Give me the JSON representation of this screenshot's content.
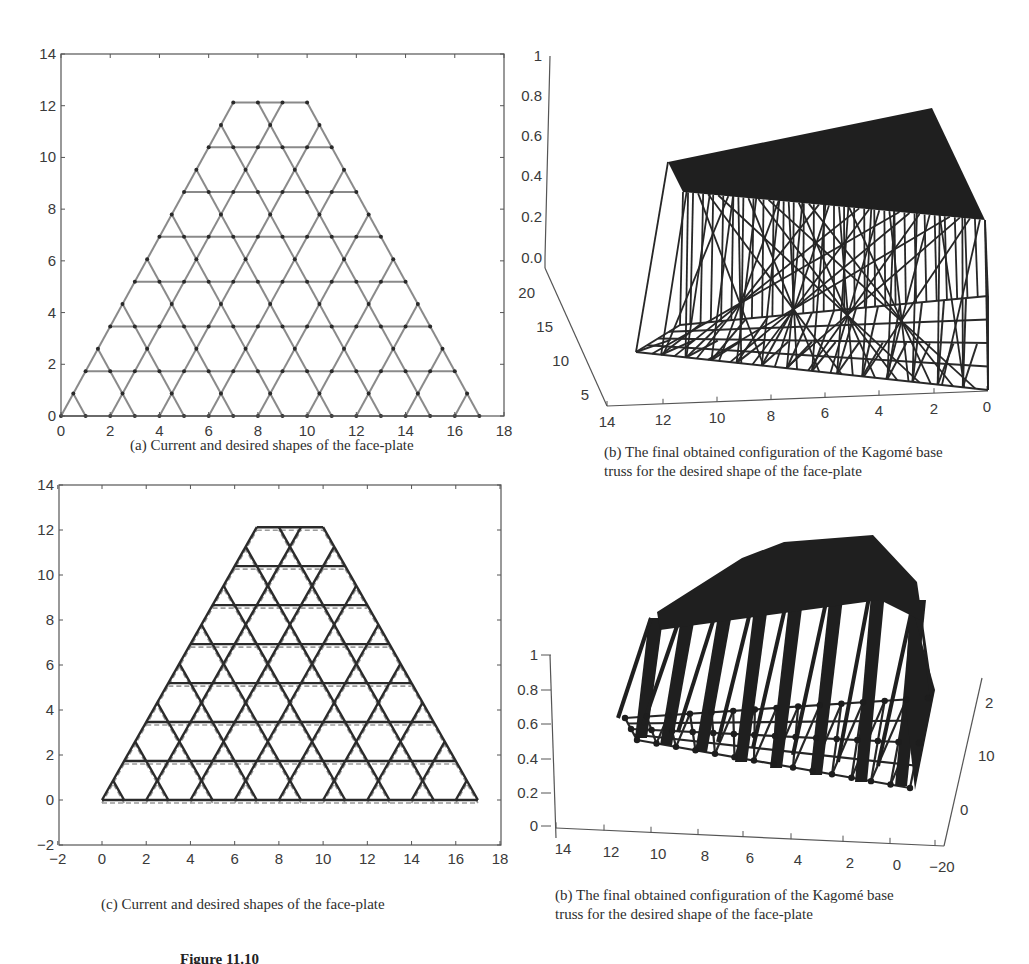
{
  "chart_data": [
    {
      "id": "a",
      "type": "line",
      "title": "",
      "caption": "(a) Current and desired shapes of the face-plate",
      "xlabel": "",
      "ylabel": "",
      "xlim": [
        0,
        18
      ],
      "ylim": [
        0,
        14
      ],
      "xticks": [
        "0",
        "2",
        "4",
        "6",
        "8",
        "10",
        "12",
        "14",
        "16",
        "18"
      ],
      "yticks": [
        "0",
        "2",
        "4",
        "6",
        "8",
        "10",
        "12",
        "14"
      ],
      "grid": false,
      "description": "Kagome truss lattice in trapezoid region; bottom edge y=0 from x=0 to 17, top edge y=12.12 from x=7 to 10",
      "lattice": {
        "bottom_left": [
          0,
          0
        ],
        "bottom_right": [
          17,
          0
        ],
        "top_left": [
          7,
          12.12
        ],
        "top_right": [
          10,
          12.12
        ],
        "rows": 7,
        "spacing": 1
      },
      "series": [
        {
          "name": "Current shape",
          "style": "solid grey with node markers",
          "color": "#8a8a8a"
        }
      ]
    },
    {
      "id": "b-top",
      "type": "line",
      "caption_line1": "(b) The final obtained configuration of the Kagomé base",
      "caption_line2": "truss for the desired shape of the face-plate",
      "projection": "3d",
      "zticks": [
        "0.0",
        "0.2",
        "0.4",
        "0.6",
        "0.8",
        "1"
      ],
      "yticks": [
        "5",
        "10",
        "15",
        "20"
      ],
      "xticks": [
        "14",
        "12",
        "10",
        "8",
        "6",
        "4",
        "2",
        "0"
      ],
      "zlim": [
        0,
        1
      ],
      "ylim": [
        0,
        22
      ],
      "xlim": [
        0,
        14
      ],
      "description": "3D wireframe: base Kagomé grid at z=0 with vertical actuators rising to a planar face-plate (z≈0.4–0.6)"
    },
    {
      "id": "c",
      "type": "line",
      "caption": "(c) Current and desired shapes of the face-plate",
      "xlim": [
        -2,
        18
      ],
      "ylim": [
        -2,
        14
      ],
      "xticks": [
        "−2",
        "0",
        "2",
        "4",
        "6",
        "8",
        "10",
        "12",
        "14",
        "16",
        "18"
      ],
      "yticks": [
        "−2",
        "0",
        "2",
        "4",
        "6",
        "8",
        "10",
        "12",
        "14"
      ],
      "grid": false,
      "series": [
        {
          "name": "Current shape",
          "style": "solid dark",
          "color": "#2b2b2b"
        },
        {
          "name": "Desired shape",
          "style": "dashed grey",
          "color": "#9a9a9a"
        }
      ]
    },
    {
      "id": "b-bottom",
      "type": "line",
      "caption_line1": "(b) The final obtained configuration of the Kagomé base",
      "caption_line2": "truss for the desired shape of the face-plate",
      "projection": "3d",
      "zticks": [
        "0",
        "0.2",
        "0.4",
        "0.6",
        "0.8",
        "1"
      ],
      "xticks": [
        "14",
        "12",
        "10",
        "8",
        "6",
        "4",
        "2",
        "0",
        "−20"
      ],
      "yticks": [
        "0",
        "10",
        "2"
      ],
      "zlim": [
        0,
        1
      ],
      "description": "3D wireframe: base grid with node markers, actuators rising to curved face-plate"
    }
  ],
  "figure_footer": "Figure 11.10"
}
